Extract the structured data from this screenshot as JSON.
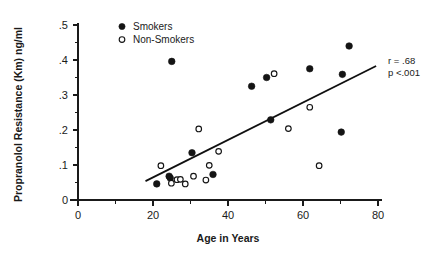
{
  "chart_data": {
    "type": "scatter",
    "title": "",
    "xlabel": "Age in Years",
    "ylabel": "Propranolol Resistance (Km) ng/ml",
    "xlim": [
      0,
      80
    ],
    "ylim": [
      0,
      0.5
    ],
    "grid": false,
    "x_ticks": [
      0,
      20,
      40,
      60,
      80
    ],
    "x_tick_labels": [
      "0",
      "20",
      "40",
      "60",
      "80"
    ],
    "x_minor_ticks": [
      10,
      30,
      50,
      70
    ],
    "y_ticks": [
      0,
      0.1,
      0.2,
      0.3,
      0.4,
      0.5
    ],
    "y_tick_labels": [
      "0",
      ".1",
      ".2",
      ".3",
      ".4",
      ".5"
    ],
    "legend_position": "top-left",
    "series": [
      {
        "name": "Smokers",
        "marker": "filled-circle",
        "color": "#141414",
        "points": [
          {
            "x": 21.0,
            "y": 0.046
          },
          {
            "x": 24.3,
            "y": 0.068
          },
          {
            "x": 24.6,
            "y": 0.063
          },
          {
            "x": 25.0,
            "y": 0.396
          },
          {
            "x": 30.4,
            "y": 0.135
          },
          {
            "x": 36.0,
            "y": 0.073
          },
          {
            "x": 46.3,
            "y": 0.325
          },
          {
            "x": 50.3,
            "y": 0.35
          },
          {
            "x": 51.4,
            "y": 0.229
          },
          {
            "x": 61.8,
            "y": 0.375
          },
          {
            "x": 70.5,
            "y": 0.359
          },
          {
            "x": 70.2,
            "y": 0.194
          },
          {
            "x": 72.3,
            "y": 0.44
          }
        ]
      },
      {
        "name": "Non-Smokers",
        "marker": "open-circle",
        "color": "#141414",
        "points": [
          {
            "x": 22.1,
            "y": 0.098
          },
          {
            "x": 24.9,
            "y": 0.048
          },
          {
            "x": 26.4,
            "y": 0.058
          },
          {
            "x": 27.3,
            "y": 0.059
          },
          {
            "x": 28.6,
            "y": 0.046
          },
          {
            "x": 30.8,
            "y": 0.068
          },
          {
            "x": 32.2,
            "y": 0.203
          },
          {
            "x": 34.1,
            "y": 0.057
          },
          {
            "x": 35.0,
            "y": 0.099
          },
          {
            "x": 37.5,
            "y": 0.139
          },
          {
            "x": 52.3,
            "y": 0.361
          },
          {
            "x": 56.1,
            "y": 0.204
          },
          {
            "x": 61.8,
            "y": 0.265
          },
          {
            "x": 64.3,
            "y": 0.098
          }
        ]
      }
    ],
    "trendline": {
      "x_start": 18.0,
      "y_start": 0.054,
      "x_end": 79.5,
      "y_end": 0.383
    },
    "annotations": {
      "r_value": "r = .68",
      "p_value": "p <.001"
    }
  },
  "legend": {
    "entries": [
      {
        "label": "Smokers",
        "marker": "filled-circle"
      },
      {
        "label": "Non-Smokers",
        "marker": "open-circle"
      }
    ]
  }
}
